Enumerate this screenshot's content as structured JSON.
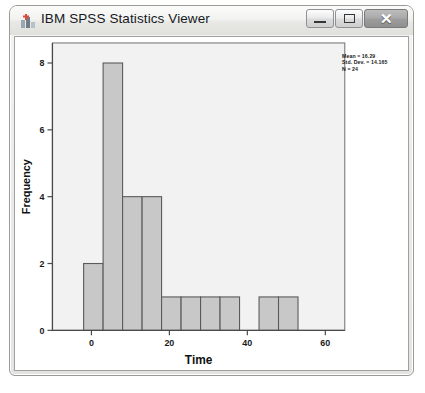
{
  "window": {
    "title": "IBM SPSS Statistics Viewer",
    "icon": "spss-app-icon",
    "controls": {
      "minimize_label": "",
      "maximize_label": "",
      "close_label": "✕"
    }
  },
  "chart_data": {
    "type": "bar",
    "chart_kind": "histogram",
    "title": "",
    "xlabel": "Time",
    "ylabel": "Frequency",
    "xlim": [
      -10,
      65
    ],
    "ylim": [
      0,
      8.6
    ],
    "xticks": [
      0,
      20,
      40,
      60
    ],
    "xtick_labels": [
      "0",
      "20",
      "40",
      "60"
    ],
    "yticks": [
      0,
      2,
      4,
      6,
      8
    ],
    "ytick_labels": [
      "0",
      "2",
      "4",
      "6",
      "8"
    ],
    "grid": false,
    "bin_width": 5,
    "bar_color": "#c8c8c8",
    "bar_edge_color": "#5a5a5a",
    "bins": [
      {
        "left": -2,
        "right": 3,
        "value": 2
      },
      {
        "left": 3,
        "right": 8,
        "value": 8
      },
      {
        "left": 8,
        "right": 13,
        "value": 4
      },
      {
        "left": 13,
        "right": 18,
        "value": 4
      },
      {
        "left": 18,
        "right": 23,
        "value": 1
      },
      {
        "left": 23,
        "right": 28,
        "value": 1
      },
      {
        "left": 28,
        "right": 33,
        "value": 1
      },
      {
        "left": 33,
        "right": 38,
        "value": 1
      },
      {
        "left": 43,
        "right": 48,
        "value": 1
      },
      {
        "left": 48,
        "right": 53,
        "value": 1
      }
    ],
    "annotations": {
      "mean": "Mean = 16.29",
      "std_dev": "Std. Dev. = 14.165",
      "n": "N = 24"
    }
  }
}
